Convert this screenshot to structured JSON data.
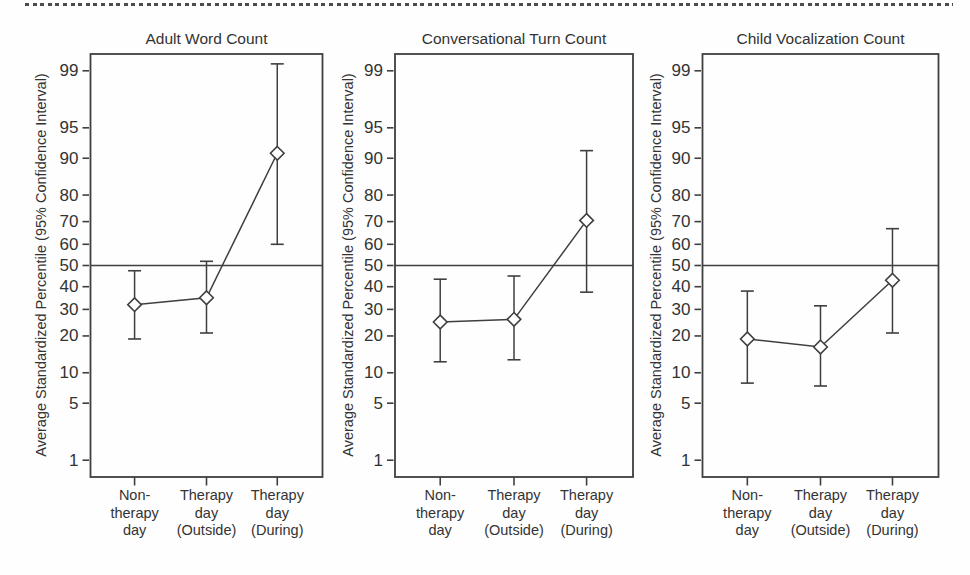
{
  "page": {
    "background": "#ffffff",
    "divider": "dotted-rule",
    "colors": {
      "stroke": "#3f3f3f",
      "text": "#333333",
      "marker_fill": "#ffffff"
    }
  },
  "chart_data": [
    {
      "type": "line",
      "scale": "probit",
      "title": "Adult Word Count",
      "ylabel": "Average Standardized Percentile (95% Confidence Interval)",
      "categories": [
        "Non-\ntherapy\nday",
        "Therapy\nday\n(Outside)",
        "Therapy\nday\n(During)"
      ],
      "values": [
        32,
        35,
        91
      ],
      "ci_lower": [
        19,
        21,
        60
      ],
      "ci_upper": [
        47.5,
        52,
        99.2
      ],
      "y_ticks": [
        1,
        5,
        10,
        20,
        30,
        40,
        50,
        60,
        70,
        80,
        90,
        95,
        99
      ],
      "reference_line": 50,
      "ylim": [
        0.6,
        99.5
      ],
      "grid": false,
      "legend": null,
      "marker": "open-diamond",
      "error_bars": "95% CI"
    },
    {
      "type": "line",
      "scale": "probit",
      "title": "Conversational Turn Count",
      "ylabel": "Average Standardized Percentile (95% Confidence Interval)",
      "categories": [
        "Non-\ntherapy\nday",
        "Therapy\nday\n(Outside)",
        "Therapy\nday\n(During)"
      ],
      "values": [
        25,
        26,
        70.5
      ],
      "ci_lower": [
        12.5,
        13,
        37.5
      ],
      "ci_upper": [
        43.5,
        45,
        91.5
      ],
      "y_ticks": [
        1,
        5,
        10,
        20,
        30,
        40,
        50,
        60,
        70,
        80,
        90,
        95,
        99
      ],
      "reference_line": 50,
      "ylim": [
        0.6,
        99.5
      ],
      "grid": false,
      "legend": null,
      "marker": "open-diamond",
      "error_bars": "95% CI"
    },
    {
      "type": "line",
      "scale": "probit",
      "title": "Child Vocalization Count",
      "ylabel": "Average Standardized Percentile (95% Confidence Interval)",
      "categories": [
        "Non-\ntherapy\nday",
        "Therapy\nday\n(Outside)",
        "Therapy\nday\n(During)"
      ],
      "values": [
        19,
        16.5,
        43
      ],
      "ci_lower": [
        8,
        7.5,
        21
      ],
      "ci_upper": [
        38,
        31.5,
        67
      ],
      "y_ticks": [
        1,
        5,
        10,
        20,
        30,
        40,
        50,
        60,
        70,
        80,
        90,
        95,
        99
      ],
      "reference_line": 50,
      "ylim": [
        0.6,
        99.5
      ],
      "grid": false,
      "legend": null,
      "marker": "open-diamond",
      "error_bars": "95% CI"
    }
  ]
}
